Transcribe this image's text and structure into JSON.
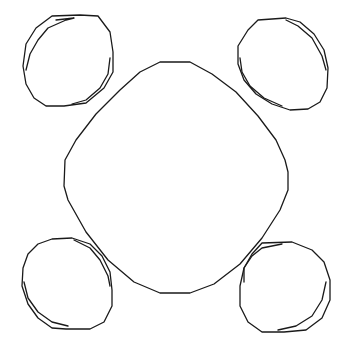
{
  "diagram": {
    "background": "#ffffff",
    "stroke_color": "#1a1a1a",
    "shapes": [
      {
        "name": "center-rounded-diamond",
        "points": "160,62 190,62 212,74 236,92 258,116 276,140 285,160 288,172 288,190 280,210 262,238 240,264 214,284 190,293 160,293 134,282 108,260 86,232 68,200 64,186 65,160 76,140 96,114 120,90 140,72"
      },
      {
        "name": "top-left-ellipse",
        "outer": "52,16 80,15 98,16 110,32 113,52 113,72 104,88 86,103 64,106 46,106 34,98 26,84 23,66 26,44 36,28",
        "inner": "56,20 74,18 66,20 48,28 38,40 30,54 28,62 26,70",
        "inner2": "110,58 108,74 100,88 86,100 72,104"
      },
      {
        "name": "top-right-ellipse",
        "outer": "258,20 286,18 300,22 314,34 324,50 328,68 327,88 320,102 308,109 290,110 272,104 256,94 244,80 238,64 238,46 248,30",
        "inner": "286,20 298,26 312,38 322,56 326,70",
        "inner2": "240,58 242,72 250,86 264,98 282,106"
      },
      {
        "name": "bottom-left-ellipse",
        "outer": "38,244 52,239 72,238 90,244 102,256 110,272 112,290 112,306 104,322 90,329 66,329 52,328 38,318 28,304 22,286 23,268 28,254",
        "inner": "74,240 90,248 100,260 108,276 110,286",
        "inner2": "24,282 28,298 38,312 52,322 68,326"
      },
      {
        "name": "bottom-right-ellipse",
        "outer": "262,243 292,242 312,250 324,262 330,280 330,300 322,318 306,330 284,332 262,332 248,322 240,306 240,286 244,268 252,254",
        "inner": "244,282 244,268 252,256 262,248 282,244",
        "inner2": "326,282 322,300 312,316 296,326 278,330"
      }
    ]
  }
}
